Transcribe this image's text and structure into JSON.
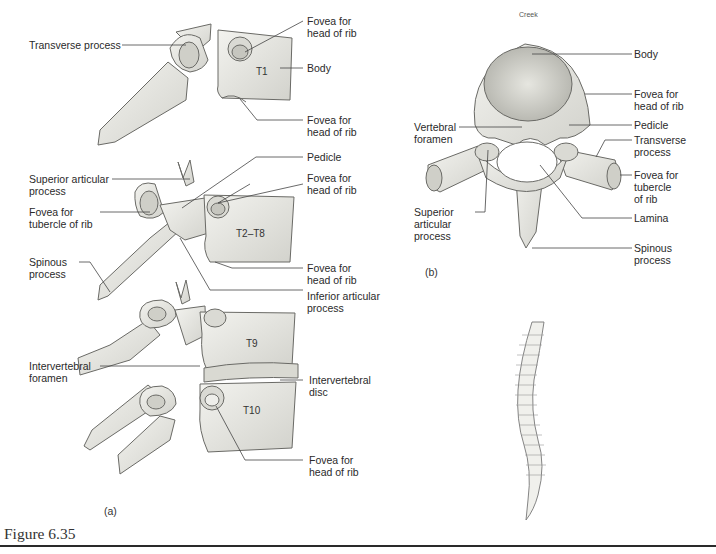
{
  "figure": {
    "title": "Figure 6.35",
    "panel_a_tag": "(a)",
    "panel_b_tag": "(b)",
    "credit": "Creek"
  },
  "panel_a": {
    "vertebra_labels": {
      "t1": "T1",
      "t2_t8": "T2–T8",
      "t9": "T9",
      "t10": "T10"
    },
    "labels": {
      "transverse_process": "Transverse process",
      "fovea_head_rib_1": "Fovea for\nhead of rib",
      "body": "Body",
      "fovea_head_rib_2": "Fovea for\nhead of rib",
      "pedicle": "Pedicle",
      "superior_articular_process": "Superior articular\nprocess",
      "fovea_head_rib_3": "Fovea for\nhead of rib",
      "fovea_tubercle_rib": "Fovea for\ntubercle of rib",
      "spinous_process": "Spinous\nprocess",
      "fovea_head_rib_4": "Fovea for\nhead of rib",
      "inferior_articular_process": "Inferior articular\nprocess",
      "intervertebral_foramen": "Intervertebral\nforamen",
      "intervertebral_disc": "Intervertebral\ndisc",
      "fovea_head_rib_5": "Fovea for\nhead of rib"
    }
  },
  "panel_b": {
    "labels": {
      "body": "Body",
      "fovea_head_rib": "Fovea for\nhead of rib",
      "pedicle": "Pedicle",
      "vertebral_foramen": "Vertebral\nforamen",
      "transverse_process": "Transverse\nprocess",
      "fovea_tubercle_rib": "Fovea for\ntubercle\nof rib",
      "superior_articular_process": "Superior\narticular\nprocess",
      "lamina": "Lamina",
      "spinous_process": "Spinous\nprocess"
    }
  },
  "colors": {
    "bone_fill": "#e9e9e4",
    "bone_stroke": "#6a6a66",
    "shade": "#bdbdb7",
    "leader": "#444444"
  }
}
